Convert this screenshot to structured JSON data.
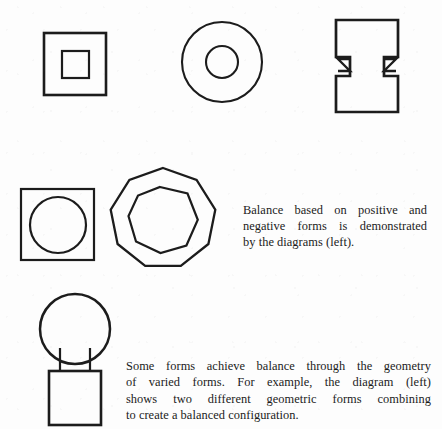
{
  "page": {
    "width": 442,
    "height": 429,
    "background_color": "#fdfdfd",
    "ink_color": "#1c1c1c",
    "kind": "scanned-textbook-page",
    "topic": "Balance in geometric form"
  },
  "figures": {
    "row_one": [
      {
        "id": "square-in-square",
        "name": "nested-squares-figure",
        "description": "Large outlined square containing a smaller concentric outlined square",
        "bounds": {
          "x": 44,
          "y": 33,
          "width": 62,
          "height": 62
        },
        "inner": {
          "x": 62,
          "y": 51,
          "width": 27,
          "height": 27
        }
      },
      {
        "id": "circle-in-circle",
        "name": "concentric-circles-figure",
        "description": "Large outlined circle containing a smaller concentric outlined circle",
        "center": {
          "x": 222,
          "y": 62
        },
        "outer_radius": 40,
        "inner_radius": 16
      },
      {
        "id": "notched-i-beam",
        "name": "notched-ibeam-figure",
        "description": "I-beam style outline with triangular wedge notches on both sides of the web",
        "bounds": {
          "x": 336,
          "y": 20,
          "width": 62,
          "height": 92
        }
      }
    ],
    "row_two": [
      {
        "id": "circle-in-square",
        "name": "circle-inscribed-in-square-figure",
        "description": "Outlined square with an inscribed circle",
        "bounds": {
          "x": 21,
          "y": 189,
          "width": 73,
          "height": 71
        },
        "circle": {
          "cx": 58,
          "cy": 225,
          "r": 28
        }
      },
      {
        "id": "polygon-in-polygon",
        "name": "nested-polygons-figure",
        "description": "Outlined nine-sided polygon containing a smaller concentric polygon",
        "center": {
          "x": 163,
          "y": 220
        },
        "outer_radius": 52,
        "inner_radius": 33,
        "sides": 9
      }
    ],
    "row_three": [
      {
        "id": "ball-on-pedestal",
        "name": "sphere-on-pedestal-figure",
        "description": "Circle atop a narrow neck resting on a square pedestal",
        "circle": {
          "cx": 75,
          "cy": 329,
          "r": 35
        },
        "neck": {
          "x": 60,
          "y": 352,
          "width": 30,
          "height": 20
        },
        "base": {
          "x": 49,
          "y": 371,
          "width": 52,
          "height": 54
        }
      }
    ]
  },
  "captions": {
    "balance": {
      "name": "balance-caption",
      "lines": [
        "Balance based on positive and",
        "negative forms is demonstrated",
        "by the diagrams (left)."
      ],
      "full_text": "Balance based on positive and negative forms is demonstrated by the diagrams (left)."
    },
    "forms": {
      "name": "forms-caption",
      "lines": [
        "Some forms achieve balance through the geometry",
        "of varied forms. For example, the  diagram (left)",
        "shows two different geometric forms combining",
        "to create a balanced configuration."
      ],
      "full_text": "Some forms achieve balance through the geometry of varied forms. For example, the diagram (left) shows two different geometric forms combining to create a balanced configuration."
    }
  }
}
